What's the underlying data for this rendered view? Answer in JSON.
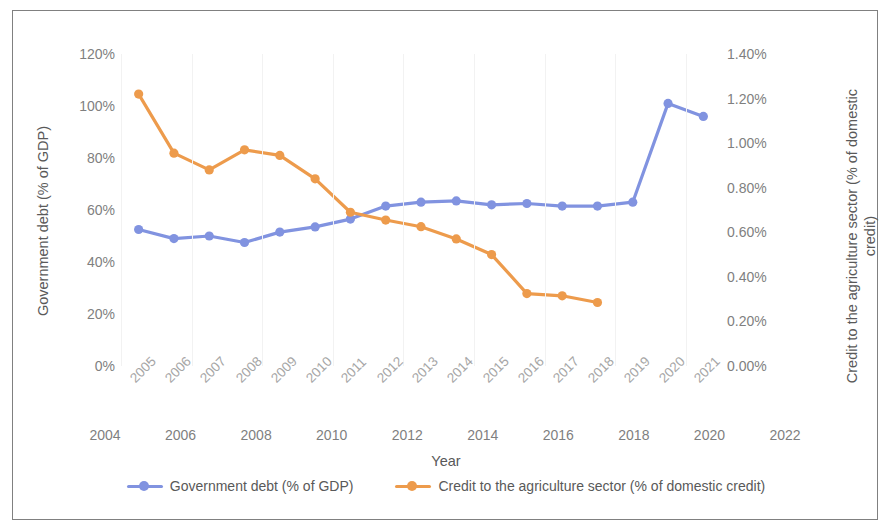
{
  "chart_data": {
    "type": "line",
    "title": "",
    "xlabel": "Year",
    "categories": [
      "2005",
      "2006",
      "2007",
      "2008",
      "2009",
      "2010",
      "2011",
      "2012",
      "2013",
      "2014",
      "2015",
      "2016",
      "2017",
      "2018",
      "2019",
      "2020",
      "2021"
    ],
    "x_secondary_ticks": [
      "2004",
      "2006",
      "2008",
      "2010",
      "2012",
      "2014",
      "2016",
      "2018",
      "2020",
      "2022"
    ],
    "grid": true,
    "legend_position": "bottom",
    "axes": {
      "left": {
        "label": "Government debt (% of GDP)",
        "ticks": [
          "0%",
          "20%",
          "40%",
          "60%",
          "80%",
          "100%",
          "120%"
        ],
        "tick_values": [
          0,
          20,
          40,
          60,
          80,
          100,
          120
        ],
        "ylim": [
          0,
          120
        ]
      },
      "right": {
        "label": "Credit to the agriculture sector (% of domestic credit)",
        "ticks": [
          "0.00%",
          "0.20%",
          "0.40%",
          "0.60%",
          "0.80%",
          "1.00%",
          "1.20%",
          "1.40%"
        ],
        "tick_values": [
          0,
          0.2,
          0.4,
          0.6,
          0.8,
          1.0,
          1.2,
          1.4
        ],
        "ylim": [
          0,
          1.4
        ]
      }
    },
    "series": [
      {
        "name": "Government debt (% of GDP)",
        "axis": "left",
        "color": "#8193e0",
        "x": [
          "2005",
          "2006",
          "2007",
          "2008",
          "2009",
          "2010",
          "2011",
          "2012",
          "2013",
          "2014",
          "2015",
          "2016",
          "2017",
          "2018",
          "2019",
          "2020",
          "2021"
        ],
        "values": [
          52.5,
          49.0,
          50.0,
          47.5,
          51.5,
          53.5,
          56.5,
          61.5,
          63.0,
          63.5,
          62.0,
          62.5,
          61.5,
          61.5,
          63.0,
          101.0,
          96.0
        ]
      },
      {
        "name": "Credit to the agriculture sector (% of domestic credit)",
        "axis": "right",
        "color": "#ed9b4c",
        "x": [
          "2005",
          "2006",
          "2007",
          "2008",
          "2009",
          "2010",
          "2011",
          "2012",
          "2013",
          "2014",
          "2015",
          "2016",
          "2017",
          "2018"
        ],
        "values": [
          1.22,
          0.955,
          0.88,
          0.97,
          0.945,
          0.84,
          0.69,
          0.655,
          0.625,
          0.57,
          0.5,
          0.325,
          0.315,
          0.285
        ]
      }
    ]
  },
  "legend": [
    {
      "label": "Government debt (% of GDP)",
      "color": "#8193e0"
    },
    {
      "label": "Credit to the agriculture sector (% of domestic credit)",
      "color": "#ed9b4c"
    }
  ]
}
